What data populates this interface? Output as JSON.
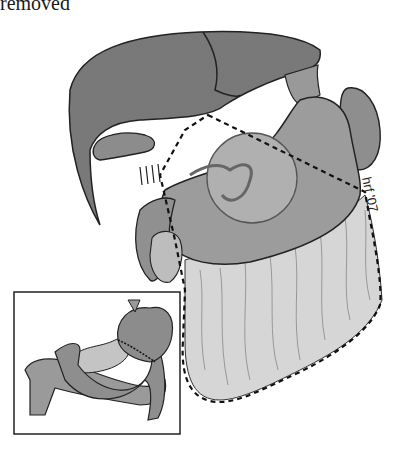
{
  "caption": "removed",
  "signature": "hrf '07",
  "figure": {
    "colors": {
      "liver": "#7a7a7a",
      "stomach": "#9a9a9a",
      "omentum": "#d4d4d4",
      "outline": "#222222",
      "background": "#ffffff"
    },
    "inset": {
      "label": "reconstruction-inset"
    }
  }
}
